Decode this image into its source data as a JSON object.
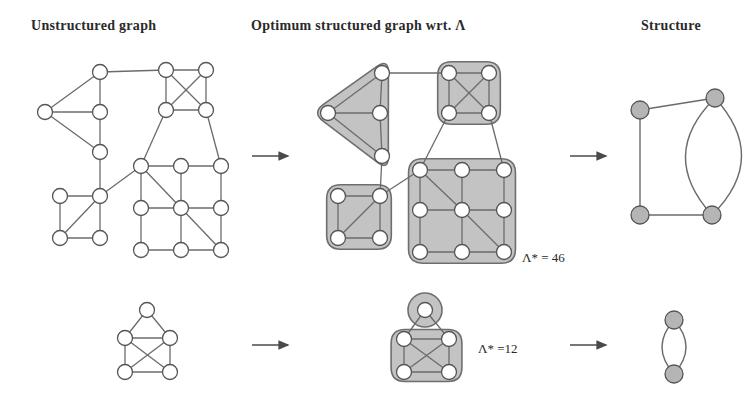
{
  "figure": {
    "name": "graph-structuring-figure",
    "columns": [
      {
        "id": "unstructured",
        "label": "Unstructured graph"
      },
      {
        "id": "optimum",
        "label": "Optimum structured graph wrt. Λ"
      },
      {
        "id": "structure",
        "label": "Structure"
      }
    ],
    "annotations": [
      {
        "id": "lambda-top",
        "text": "Λ* = 46"
      },
      {
        "id": "lambda-bottom",
        "text": "Λ* =12"
      }
    ],
    "arrows": [
      {
        "id": "arrow-row1-left",
        "from": "unstructured",
        "to": "optimum"
      },
      {
        "id": "arrow-row1-right",
        "from": "optimum",
        "to": "structure"
      },
      {
        "id": "arrow-row2-left",
        "from": "unstructured",
        "to": "optimum"
      },
      {
        "id": "arrow-row2-right",
        "from": "optimum",
        "to": "structure"
      }
    ],
    "colors": {
      "node_fill": "#ffffff",
      "node_stroke": "#555555",
      "edge": "#6b6b6b",
      "cluster_fill": "#b9b9b9",
      "cluster_stroke": "#6e6e6e",
      "structure_node_fill": "#b5b5b5",
      "text": "#2a2a2a",
      "background": "#ffffff"
    },
    "row1": {
      "unstructured_graph": {
        "nodes": [
          {
            "id": "a1",
            "x": 100,
            "y": 72
          },
          {
            "id": "a2",
            "x": 45,
            "y": 112
          },
          {
            "id": "a3",
            "x": 100,
            "y": 112
          },
          {
            "id": "a4",
            "x": 100,
            "y": 152
          },
          {
            "id": "b1",
            "x": 166,
            "y": 70
          },
          {
            "id": "b2",
            "x": 206,
            "y": 70
          },
          {
            "id": "b3",
            "x": 166,
            "y": 110
          },
          {
            "id": "b4",
            "x": 206,
            "y": 110
          },
          {
            "id": "c1",
            "x": 60,
            "y": 196
          },
          {
            "id": "c2",
            "x": 100,
            "y": 196
          },
          {
            "id": "c3",
            "x": 60,
            "y": 238
          },
          {
            "id": "c4",
            "x": 100,
            "y": 238
          },
          {
            "id": "g1",
            "x": 141,
            "y": 166
          },
          {
            "id": "g2",
            "x": 181,
            "y": 166
          },
          {
            "id": "g3",
            "x": 221,
            "y": 166
          },
          {
            "id": "g4",
            "x": 141,
            "y": 208
          },
          {
            "id": "g5",
            "x": 181,
            "y": 208
          },
          {
            "id": "g6",
            "x": 221,
            "y": 208
          },
          {
            "id": "g7",
            "x": 141,
            "y": 250
          },
          {
            "id": "g8",
            "x": 181,
            "y": 250
          },
          {
            "id": "g9",
            "x": 221,
            "y": 250
          }
        ],
        "edges": [
          [
            "a1",
            "a2"
          ],
          [
            "a1",
            "a3"
          ],
          [
            "a2",
            "a3"
          ],
          [
            "a2",
            "a4"
          ],
          [
            "a3",
            "a4"
          ],
          [
            "a1",
            "b1"
          ],
          [
            "b1",
            "b2"
          ],
          [
            "b1",
            "b3"
          ],
          [
            "b1",
            "b4"
          ],
          [
            "b2",
            "b3"
          ],
          [
            "b2",
            "b4"
          ],
          [
            "b3",
            "b4"
          ],
          [
            "a4",
            "c2"
          ],
          [
            "b3",
            "g1"
          ],
          [
            "b4",
            "g3"
          ],
          [
            "c1",
            "c2"
          ],
          [
            "c1",
            "c3"
          ],
          [
            "c2",
            "c3"
          ],
          [
            "c2",
            "c4"
          ],
          [
            "c3",
            "c4"
          ],
          [
            "c2",
            "g1"
          ],
          [
            "g1",
            "g2"
          ],
          [
            "g2",
            "g3"
          ],
          [
            "g1",
            "g4"
          ],
          [
            "g2",
            "g5"
          ],
          [
            "g3",
            "g6"
          ],
          [
            "g4",
            "g5"
          ],
          [
            "g5",
            "g6"
          ],
          [
            "g4",
            "g7"
          ],
          [
            "g5",
            "g8"
          ],
          [
            "g6",
            "g9"
          ],
          [
            "g7",
            "g8"
          ],
          [
            "g8",
            "g9"
          ],
          [
            "g1",
            "g5"
          ],
          [
            "g5",
            "g9"
          ]
        ]
      },
      "structured_graph": {
        "clusters": [
          {
            "id": "cluster-triangle",
            "members": [
              "t1",
              "t2",
              "t3",
              "t4"
            ]
          },
          {
            "id": "cluster-clique",
            "members": [
              "q1",
              "q2",
              "q3",
              "q4"
            ]
          },
          {
            "id": "cluster-square",
            "members": [
              "s1",
              "s2",
              "s3",
              "s4"
            ]
          },
          {
            "id": "cluster-grid",
            "members": [
              "m1",
              "m2",
              "m3",
              "m4",
              "m5",
              "m6",
              "m7",
              "m8",
              "m9"
            ]
          }
        ],
        "nodes": [
          {
            "id": "t1",
            "x": 382,
            "y": 73
          },
          {
            "id": "t2",
            "x": 328,
            "y": 113
          },
          {
            "id": "t3",
            "x": 380,
            "y": 113
          },
          {
            "id": "t4",
            "x": 382,
            "y": 156
          },
          {
            "id": "q1",
            "x": 449,
            "y": 73
          },
          {
            "id": "q2",
            "x": 489,
            "y": 73
          },
          {
            "id": "q3",
            "x": 449,
            "y": 113
          },
          {
            "id": "q4",
            "x": 489,
            "y": 113
          },
          {
            "id": "s1",
            "x": 338,
            "y": 196
          },
          {
            "id": "s2",
            "x": 380,
            "y": 196
          },
          {
            "id": "s3",
            "x": 338,
            "y": 238
          },
          {
            "id": "s4",
            "x": 380,
            "y": 238
          },
          {
            "id": "m1",
            "x": 420,
            "y": 170
          },
          {
            "id": "m2",
            "x": 462,
            "y": 170
          },
          {
            "id": "m3",
            "x": 504,
            "y": 170
          },
          {
            "id": "m4",
            "x": 420,
            "y": 210
          },
          {
            "id": "m5",
            "x": 462,
            "y": 210
          },
          {
            "id": "m6",
            "x": 504,
            "y": 210
          },
          {
            "id": "m7",
            "x": 420,
            "y": 252
          },
          {
            "id": "m8",
            "x": 462,
            "y": 252
          },
          {
            "id": "m9",
            "x": 504,
            "y": 252
          }
        ],
        "edges": [
          [
            "t1",
            "t2"
          ],
          [
            "t1",
            "t3"
          ],
          [
            "t2",
            "t3"
          ],
          [
            "t2",
            "t4"
          ],
          [
            "t3",
            "t4"
          ],
          [
            "q1",
            "q2"
          ],
          [
            "q1",
            "q3"
          ],
          [
            "q1",
            "q4"
          ],
          [
            "q2",
            "q3"
          ],
          [
            "q2",
            "q4"
          ],
          [
            "q3",
            "q4"
          ],
          [
            "s1",
            "s2"
          ],
          [
            "s1",
            "s3"
          ],
          [
            "s2",
            "s3"
          ],
          [
            "s2",
            "s4"
          ],
          [
            "s3",
            "s4"
          ],
          [
            "m1",
            "m2"
          ],
          [
            "m2",
            "m3"
          ],
          [
            "m1",
            "m4"
          ],
          [
            "m2",
            "m5"
          ],
          [
            "m3",
            "m6"
          ],
          [
            "m4",
            "m5"
          ],
          [
            "m5",
            "m6"
          ],
          [
            "m4",
            "m7"
          ],
          [
            "m5",
            "m8"
          ],
          [
            "m6",
            "m9"
          ],
          [
            "m7",
            "m8"
          ],
          [
            "m8",
            "m9"
          ],
          [
            "m1",
            "m5"
          ],
          [
            "m5",
            "m9"
          ],
          [
            "t1",
            "q1"
          ],
          [
            "t4",
            "s2"
          ],
          [
            "q3",
            "m1"
          ],
          [
            "q4",
            "m3"
          ],
          [
            "s2",
            "m1"
          ]
        ]
      },
      "structure_graph": {
        "nodes": [
          {
            "id": "h1",
            "x": 640,
            "y": 110
          },
          {
            "id": "h2",
            "x": 715,
            "y": 98
          },
          {
            "id": "h3",
            "x": 640,
            "y": 215
          },
          {
            "id": "h4",
            "x": 712,
            "y": 215
          }
        ],
        "edges": [
          {
            "from": "h1",
            "to": "h2",
            "curve": 0
          },
          {
            "from": "h1",
            "to": "h3",
            "curve": 0
          },
          {
            "from": "h3",
            "to": "h4",
            "curve": 0
          },
          {
            "from": "h2",
            "to": "h4",
            "curve": 28
          },
          {
            "from": "h2",
            "to": "h4",
            "curve": -28
          }
        ]
      }
    },
    "row2": {
      "unstructured_graph": {
        "nodes": [
          {
            "id": "p0",
            "x": 147,
            "y": 310
          },
          {
            "id": "p1",
            "x": 125,
            "y": 338
          },
          {
            "id": "p2",
            "x": 170,
            "y": 338
          },
          {
            "id": "p3",
            "x": 125,
            "y": 372
          },
          {
            "id": "p4",
            "x": 170,
            "y": 372
          }
        ],
        "edges": [
          [
            "p0",
            "p1"
          ],
          [
            "p0",
            "p2"
          ],
          [
            "p1",
            "p2"
          ],
          [
            "p1",
            "p3"
          ],
          [
            "p2",
            "p4"
          ],
          [
            "p1",
            "p4"
          ],
          [
            "p2",
            "p3"
          ],
          [
            "p3",
            "p4"
          ]
        ]
      },
      "structured_graph": {
        "clusters": [
          {
            "id": "cluster-single",
            "members": [
              "r0"
            ]
          },
          {
            "id": "cluster-quad",
            "members": [
              "r1",
              "r2",
              "r3",
              "r4"
            ]
          }
        ],
        "nodes": [
          {
            "id": "r0",
            "x": 425,
            "y": 310
          },
          {
            "id": "r1",
            "x": 404,
            "y": 339
          },
          {
            "id": "r2",
            "x": 449,
            "y": 339
          },
          {
            "id": "r3",
            "x": 404,
            "y": 372
          },
          {
            "id": "r4",
            "x": 449,
            "y": 372
          }
        ],
        "edges": [
          [
            "r0",
            "r1"
          ],
          [
            "r0",
            "r2"
          ],
          [
            "r1",
            "r2"
          ],
          [
            "r1",
            "r3"
          ],
          [
            "r2",
            "r4"
          ],
          [
            "r1",
            "r4"
          ],
          [
            "r2",
            "r3"
          ],
          [
            "r3",
            "r4"
          ]
        ]
      },
      "structure_graph": {
        "nodes": [
          {
            "id": "k1",
            "x": 674,
            "y": 320
          },
          {
            "id": "k2",
            "x": 674,
            "y": 374
          }
        ],
        "edges": [
          {
            "from": "k1",
            "to": "k2",
            "curve": 12
          },
          {
            "from": "k1",
            "to": "k2",
            "curve": -12
          }
        ]
      }
    }
  }
}
